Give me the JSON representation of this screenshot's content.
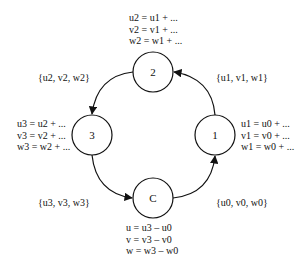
{
  "nodes": [
    {
      "id": "2",
      "label": "2",
      "cx": 153,
      "cy": 72
    },
    {
      "id": "3",
      "label": "3",
      "cx": 92,
      "cy": 135
    },
    {
      "id": "1",
      "label": "1",
      "cx": 215,
      "cy": 135
    },
    {
      "id": "C",
      "label": "C",
      "cx": 153,
      "cy": 198
    }
  ],
  "equations": {
    "node2": [
      "u2 = u1 + ...",
      "v2 = v1 + ...",
      "w2 = w1 + ..."
    ],
    "node3": [
      "u3 = u2 + ...",
      "v3 = v2 + ...",
      "w3 = w2 + ..."
    ],
    "node1": [
      "u1 = u0 + ...",
      "v1 = v0 + ...",
      "w1 = w0 + ..."
    ],
    "nodeC": [
      "u = u3 – u0",
      "v = v3 – v0",
      "w = w3 – w0"
    ]
  },
  "edges": [
    {
      "from": "1",
      "to": "2",
      "label": "{u1, v1, w1}"
    },
    {
      "from": "2",
      "to": "3",
      "label": "{u2, v2, w2}"
    },
    {
      "from": "3",
      "to": "C",
      "label": "{u3, v3, w3}"
    },
    {
      "from": "C",
      "to": "1",
      "label": "{u0, v0, w0}"
    }
  ]
}
